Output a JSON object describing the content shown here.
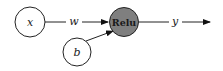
{
  "diagram": {
    "nodes": [
      {
        "id": "x",
        "label": "x",
        "cx": 30,
        "cy": 22,
        "r": 15,
        "fill": "#ffffff"
      },
      {
        "id": "b",
        "label": "b",
        "cx": 77,
        "cy": 52,
        "r": 14,
        "fill": "#ffffff"
      },
      {
        "id": "relu",
        "label": "Relu",
        "cx": 124,
        "cy": 22,
        "r": 14.5,
        "fill": "#7f7f7f"
      }
    ],
    "edges": [
      {
        "from": "x",
        "to": "relu",
        "label": "w"
      },
      {
        "from": "b",
        "to": "relu",
        "label": ""
      },
      {
        "from": "relu",
        "to": "output",
        "label": "y"
      }
    ],
    "colors": {
      "stroke": "#222222",
      "relu_fill": "#7f7f7f",
      "background": "#ffffff"
    }
  }
}
